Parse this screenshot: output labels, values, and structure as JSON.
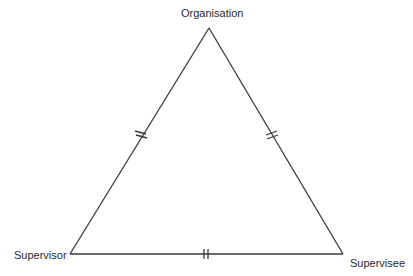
{
  "diagram": {
    "type": "triangle",
    "stroke_color": "#3a3a3a",
    "vertices": {
      "top": {
        "label": "Organisation",
        "x": 209,
        "y": 28
      },
      "bottom_left": {
        "label": "Supervisor",
        "x": 70,
        "y": 254
      },
      "bottom_right": {
        "label": "Supervisee",
        "x": 343,
        "y": 254
      }
    },
    "edges": [
      {
        "from": "Supervisor",
        "to": "Organisation",
        "tick_mark": "double"
      },
      {
        "from": "Organisation",
        "to": "Supervisee",
        "tick_mark": "double"
      },
      {
        "from": "Supervisor",
        "to": "Supervisee",
        "tick_mark": "double"
      }
    ]
  }
}
